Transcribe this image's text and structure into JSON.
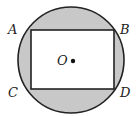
{
  "diagram": {
    "type": "geometry",
    "colors": {
      "shade": "#c8c8c8",
      "stroke": "#222222",
      "rect_fill": "#ffffff"
    },
    "circle": {
      "cx": 71,
      "cy": 60,
      "r": 54
    },
    "rectangle": {
      "x": 31,
      "y": 30,
      "width": 83,
      "height": 59
    },
    "center": {
      "label": "O",
      "x": 73,
      "y": 61
    },
    "vertices": [
      {
        "label": "A",
        "x": 31,
        "y": 30
      },
      {
        "label": "B",
        "x": 114,
        "y": 30
      },
      {
        "label": "C",
        "x": 31,
        "y": 89
      },
      {
        "label": "D",
        "x": 114,
        "y": 89
      }
    ]
  }
}
